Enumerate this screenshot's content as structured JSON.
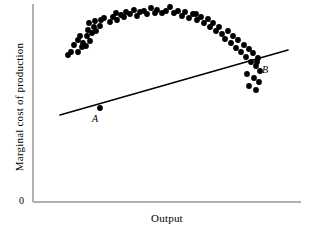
{
  "chart_data": {
    "type": "scatter",
    "title": "",
    "subtitle": "",
    "xlabel": "Output",
    "ylabel": "Marginal cost of production",
    "origin_label": "0",
    "grid": false,
    "legend": null,
    "xlim": [
      0,
      100
    ],
    "ylim": [
      0,
      100
    ],
    "axis_ticks": {
      "x": [],
      "y": []
    },
    "series": [
      {
        "name": "Marginal cost observations",
        "type": "scatter",
        "marker": "filled-circle",
        "color": "#000000",
        "marker_size_px": 4,
        "points": [
          [
            71,
            52
          ],
          [
            78,
            52
          ],
          [
            82,
            47
          ],
          [
            86,
            46
          ],
          [
            78,
            40
          ],
          [
            83,
            43
          ],
          [
            87,
            36
          ],
          [
            90,
            41
          ],
          [
            92,
            33
          ],
          [
            96,
            31
          ],
          [
            68,
            55
          ],
          [
            74,
            45
          ],
          [
            80,
            36
          ],
          [
            88,
            30
          ],
          [
            94,
            27
          ],
          [
            89,
            23
          ],
          [
            95,
            21
          ],
          [
            100,
            26
          ],
          [
            101,
            20
          ],
          [
            104,
            18
          ],
          [
            110,
            22
          ],
          [
            113,
            17
          ],
          [
            117,
            20
          ],
          [
            116,
            13
          ],
          [
            121,
            15
          ],
          [
            126,
            12
          ],
          [
            124,
            17
          ],
          [
            130,
            14
          ],
          [
            134,
            10
          ],
          [
            137,
            16
          ],
          [
            140,
            12
          ],
          [
            144,
            11
          ],
          [
            147,
            14
          ],
          [
            151,
            8
          ],
          [
            155,
            13
          ],
          [
            157,
            10
          ],
          [
            162,
            13
          ],
          [
            166,
            11
          ],
          [
            170,
            7
          ],
          [
            174,
            13
          ],
          [
            178,
            11
          ],
          [
            182,
            16
          ],
          [
            185,
            12
          ],
          [
            189,
            18
          ],
          [
            193,
            14
          ],
          [
            197,
            20
          ],
          [
            196,
            14
          ],
          [
            201,
            17
          ],
          [
            204,
            23
          ],
          [
            208,
            19
          ],
          [
            210,
            27
          ],
          [
            213,
            23
          ],
          [
            216,
            31
          ],
          [
            219,
            27
          ],
          [
            222,
            34
          ],
          [
            225,
            39
          ],
          [
            228,
            31
          ],
          [
            231,
            43
          ],
          [
            233,
            36
          ],
          [
            236,
            48
          ],
          [
            238,
            40
          ],
          [
            241,
            52
          ],
          [
            244,
            45
          ],
          [
            246,
            57
          ],
          [
            249,
            49
          ],
          [
            251,
            62
          ],
          [
            253,
            53
          ],
          [
            256,
            66
          ],
          [
            258,
            58
          ],
          [
            260,
            71
          ],
          [
            247,
            74
          ],
          [
            254,
            78
          ],
          [
            259,
            82
          ],
          [
            249,
            86
          ],
          [
            256,
            90
          ]
        ],
        "description": "U-shaped cloud of marginal cost observations versus output"
      },
      {
        "name": "Fitted linear trend line",
        "type": "line",
        "color": "#000000",
        "width_px": 1.6,
        "endpoints": [
          [
            60,
            115
          ],
          [
            288,
            50
          ]
        ],
        "description": "Upward-sloping straight line drawn through the scatter, crossing it at A and B"
      }
    ],
    "annotations": [
      {
        "name": "point-a",
        "label": "A",
        "style": "italic-serif",
        "marker_x": 100,
        "marker_y": 108,
        "label_x": 92,
        "label_y": 113,
        "description": "Lower-left intersection of trend line with the falling branch"
      },
      {
        "name": "point-b",
        "label": "B",
        "style": "italic-serif",
        "marker_x": 257,
        "marker_y": 62,
        "label_x": 262,
        "label_y": 64,
        "description": "Upper-right intersection of trend line with the rising branch"
      }
    ],
    "axis_style": {
      "color": "#b0b0b0",
      "width_px": 1.4,
      "x_axis": [
        [
          33,
          202
        ],
        [
          301,
          202
        ]
      ],
      "y_axis": [
        [
          33,
          4
        ],
        [
          33,
          202
        ]
      ],
      "spines": [
        "left",
        "bottom"
      ]
    }
  }
}
